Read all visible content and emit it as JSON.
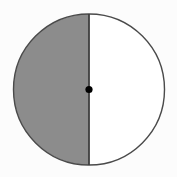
{
  "figure": {
    "name": "circle-with-vertical-diameter",
    "title": "Circle divided by a vertical diameter with the left half shaded",
    "background_color": "#fcfcfc",
    "canvas": {
      "width": 177,
      "height": 177
    },
    "circle": {
      "center_x": 89,
      "center_y": 89.5,
      "radius": 75.5,
      "outline_color": "#4a4a4a",
      "outline_width": 1.4
    },
    "halves": [
      {
        "label": "left-half",
        "side": "left",
        "fill_color": "#8c8c8c",
        "shaded": "shaded",
        "fraction": "1/2"
      },
      {
        "label": "right-half",
        "side": "right",
        "fill_color": "#ffffff",
        "shaded": "unshaded",
        "fraction": "1/2"
      }
    ],
    "diameter_line": {
      "name": "vertical-diameter",
      "orientation": "vertical",
      "x": 89,
      "y_start": 14,
      "y_end": 165,
      "color": "#3f3f3f",
      "width": 1.8
    },
    "center_point": {
      "name": "center-point",
      "x": 89,
      "y": 89.5,
      "radius": 3.6,
      "color": "#000000"
    }
  }
}
